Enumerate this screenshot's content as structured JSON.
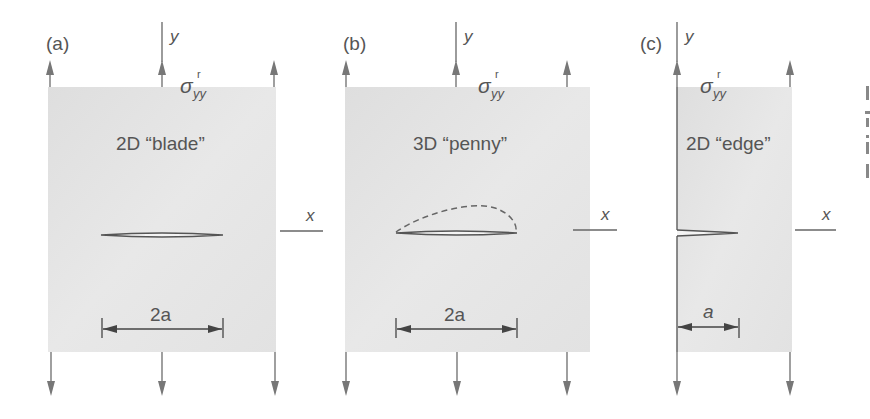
{
  "figure": {
    "panels": [
      {
        "id": "a",
        "label": "(a)",
        "title": "2D “blade”",
        "stress_symbol": "σ",
        "stress_superscript": "r",
        "stress_subscript": "yy",
        "y_axis_label": "y",
        "x_axis_label": "x",
        "dimension_label": "2a",
        "crack_type": "through-thickness blade crack"
      },
      {
        "id": "b",
        "label": "(b)",
        "title": "3D “penny”",
        "stress_symbol": "σ",
        "stress_superscript": "r",
        "stress_subscript": "yy",
        "y_axis_label": "y",
        "x_axis_label": "x",
        "dimension_label": "2a",
        "crack_type": "penny-shaped crack (dashed out-of-plane profile)"
      },
      {
        "id": "c",
        "label": "(c)",
        "title": "2D “edge”",
        "stress_symbol": "σ",
        "stress_superscript": "r",
        "stress_subscript": "yy",
        "y_axis_label": "y",
        "x_axis_label": "x",
        "dimension_label": "a",
        "crack_type": "edge crack"
      }
    ],
    "colors": {
      "plate_fill": "#e3e3e3",
      "arrow": "#777777",
      "crack_line": "#555555",
      "text": "#555555"
    }
  }
}
